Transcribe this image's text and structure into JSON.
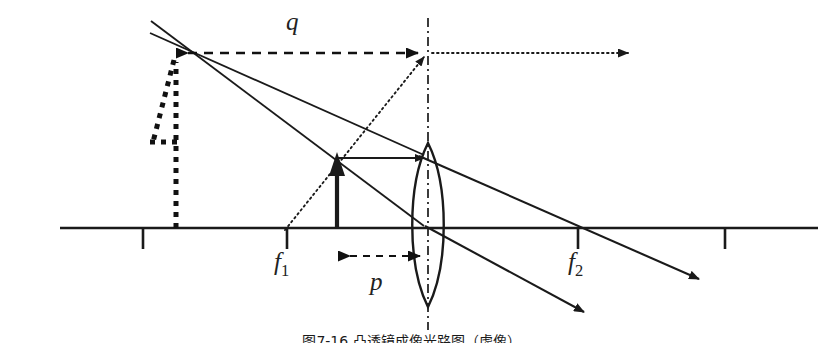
{
  "figure": {
    "type": "optics-ray-diagram",
    "caption": "图7-16  凸透镜成像光路图（虚像）",
    "background_color": "#ffffff",
    "stroke_color": "#1a1a1a",
    "width": 823,
    "height": 343
  },
  "labels": {
    "image_distance": "q",
    "object_distance": "p",
    "focal_left": "f",
    "focal_left_sub": "1",
    "focal_right": "f",
    "focal_right_sub": "2"
  },
  "geometry": {
    "optical_axis": {
      "x1": 60,
      "y1": 228,
      "x2": 818,
      "y2": 228
    },
    "lens": {
      "center_x": 428,
      "top_y": 145,
      "bottom_y": 305,
      "half_width": 20,
      "axis_line": {
        "x": 428,
        "y1": 20,
        "y2": 328,
        "style": "dash-dot"
      }
    },
    "axis_ticks": [
      {
        "name": "tick-image-foot",
        "x": 143,
        "y_top": 228,
        "y_bottom": 249
      },
      {
        "name": "tick-focal-left",
        "x": 287,
        "y_top": 228,
        "y_bottom": 249
      },
      {
        "name": "tick-focal-right",
        "x": 578,
        "y_top": 228,
        "y_bottom": 249
      },
      {
        "name": "tick-far-right",
        "x": 725,
        "y_top": 228,
        "y_bottom": 249
      }
    ],
    "object_arrow": {
      "x": 337,
      "base_y": 228,
      "tip_y": 158
    },
    "image_arrow": {
      "x": 176,
      "base_y": 228,
      "tip_y": 55,
      "style": "dashed"
    },
    "q_dimension": {
      "x1": 179,
      "x2": 428,
      "y": 53
    },
    "p_dimension": {
      "x1": 340,
      "x2": 428,
      "y": 256
    },
    "ray_parallel": {
      "x1": 337,
      "y1": 158,
      "x2": 428,
      "y2": 158
    },
    "ray_dotted_through_focus": {
      "x1": 287,
      "y1": 228,
      "x2": 428,
      "y2": 53
    },
    "ray_dotted_exit": {
      "x1": 430,
      "y1": 53,
      "x2": 636,
      "y2": 53
    },
    "refracted_ray_upper": {
      "x1": 428,
      "y1": 158,
      "x2": 707,
      "y2": 281
    },
    "refracted_ray_lower": {
      "x1": 428,
      "y1": 228,
      "x2": 592,
      "y2": 316
    },
    "virtual_ray_upper": {
      "x1": 428,
      "y1": 158,
      "x2": 150,
      "y2": 35
    },
    "virtual_ray_lower": {
      "x1": 428,
      "y1": 228,
      "x2": 152,
      "y2": 22
    }
  }
}
